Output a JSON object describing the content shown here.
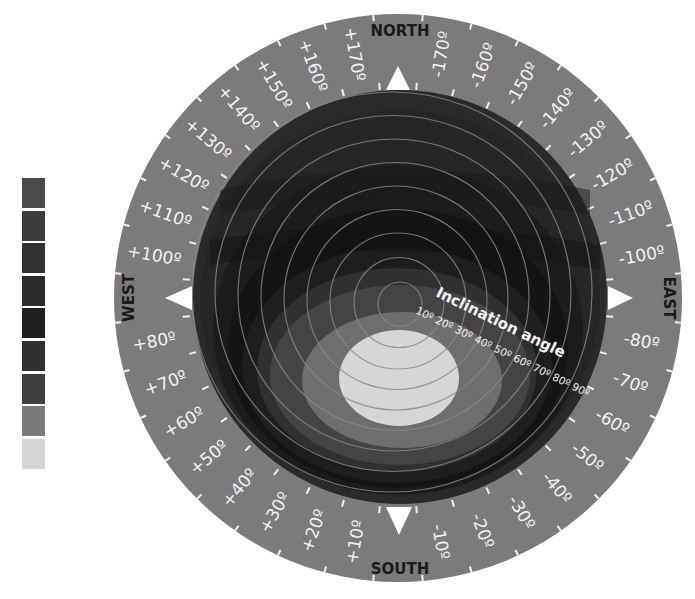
{
  "diagram": {
    "type": "polar-sky-diagram",
    "compass": {
      "north": "NORTH",
      "south": "SOUTH",
      "east": "EAST",
      "west": "WEST"
    },
    "azimuth_labels": [
      {
        "angle_deg": 10,
        "label": "+10º"
      },
      {
        "angle_deg": 20,
        "label": "+20º"
      },
      {
        "angle_deg": 30,
        "label": "+30º"
      },
      {
        "angle_deg": 40,
        "label": "+40º"
      },
      {
        "angle_deg": 50,
        "label": "+50º"
      },
      {
        "angle_deg": 60,
        "label": "+60º"
      },
      {
        "angle_deg": 70,
        "label": "+70º"
      },
      {
        "angle_deg": 80,
        "label": "+80º"
      },
      {
        "angle_deg": 100,
        "label": "+100º"
      },
      {
        "angle_deg": 110,
        "label": "+110º"
      },
      {
        "angle_deg": 120,
        "label": "+120º"
      },
      {
        "angle_deg": 130,
        "label": "+130º"
      },
      {
        "angle_deg": 140,
        "label": "+140º"
      },
      {
        "angle_deg": 150,
        "label": "+150º"
      },
      {
        "angle_deg": 160,
        "label": "+160º"
      },
      {
        "angle_deg": 170,
        "label": "+170º"
      },
      {
        "angle_deg": -170,
        "label": "-170º"
      },
      {
        "angle_deg": -160,
        "label": "-160º"
      },
      {
        "angle_deg": -150,
        "label": "-150º"
      },
      {
        "angle_deg": -140,
        "label": "-140º"
      },
      {
        "angle_deg": -130,
        "label": "-130º"
      },
      {
        "angle_deg": -120,
        "label": "-120º"
      },
      {
        "angle_deg": -110,
        "label": "-110º"
      },
      {
        "angle_deg": -100,
        "label": "-100º"
      },
      {
        "angle_deg": -80,
        "label": "-80º"
      },
      {
        "angle_deg": -70,
        "label": "-70º"
      },
      {
        "angle_deg": -60,
        "label": "-60º"
      },
      {
        "angle_deg": -50,
        "label": "-50º"
      },
      {
        "angle_deg": -40,
        "label": "-40º"
      },
      {
        "angle_deg": -30,
        "label": "-30º"
      },
      {
        "angle_deg": -20,
        "label": "-20º"
      },
      {
        "angle_deg": -10,
        "label": "-10º"
      }
    ],
    "inclination": {
      "title": "Inclination angle",
      "ticks": [
        "10º",
        "20º",
        "30º",
        "40º",
        "50º",
        "60º",
        "70º",
        "80º",
        "90º"
      ]
    },
    "legend": {
      "colors": [
        "#4a4a4a",
        "#3c3c3c",
        "#323232",
        "#2a2a2a",
        "#1f1f1f",
        "#303030",
        "#3f3f3f",
        "#7a7a7a",
        "#d4d4d4"
      ]
    },
    "colors": {
      "ring": "#7b7b7b",
      "disc_outer": "#2b2b2b",
      "contour_lines": "#8a8a8a",
      "marker": "#ffffff"
    }
  }
}
